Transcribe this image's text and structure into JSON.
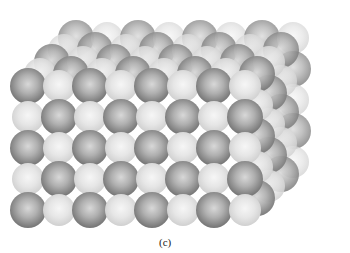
{
  "figure": {
    "caption": "(c)"
  },
  "lattice": {
    "columns": 8,
    "rows": 5,
    "depth_layers": 5,
    "front_origin": {
      "x": 28,
      "y": 210
    },
    "spacing": {
      "x": 31,
      "y": 31
    },
    "depth_offset": {
      "x": 12,
      "y": -12
    },
    "dark_diameter": 36,
    "light_diameter": 32,
    "colors": {
      "dark": "#7a7a7a",
      "light": "#e6e6e6",
      "background": "#ffffff"
    }
  }
}
